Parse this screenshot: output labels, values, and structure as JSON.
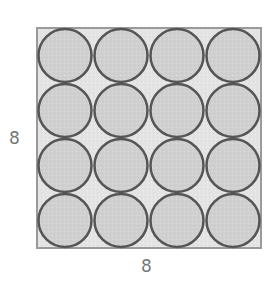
{
  "diagram": {
    "square": {
      "x": 37,
      "y": 28,
      "size": 224,
      "fill": "#e6e6e6",
      "stroke": "#999999"
    },
    "circles": {
      "rows": 4,
      "cols": 4,
      "fill": "#d2d2d2",
      "stroke": "#555555"
    },
    "labels": {
      "side_left": "8",
      "side_bottom": "8"
    }
  }
}
